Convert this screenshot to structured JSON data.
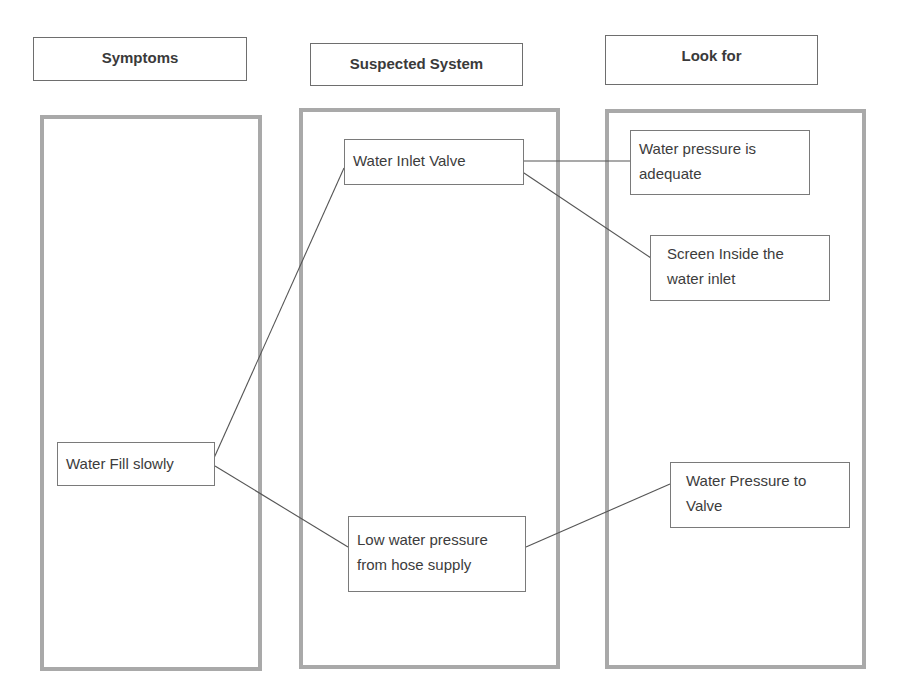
{
  "headers": {
    "symptoms": "Symptoms",
    "suspected_system": "Suspected System",
    "look_for": "Look for"
  },
  "nodes": {
    "symptom_water_fill": "Water Fill slowly",
    "system_inlet_valve": "Water Inlet Valve",
    "system_low_pressure": "Low water pressure from hose supply",
    "look_pressure_adequate": "Water pressure is adequate",
    "look_screen_inside": "Screen Inside the water inlet",
    "look_pressure_to_valve": "Water Pressure to Valve"
  },
  "connections": [
    {
      "from": "Water Fill slowly",
      "to": "Water Inlet Valve"
    },
    {
      "from": "Water Fill slowly",
      "to": "Low water pressure from hose supply"
    },
    {
      "from": "Water Inlet Valve",
      "to": "Water pressure is adequate"
    },
    {
      "from": "Water Inlet Valve",
      "to": "Screen Inside the water inlet"
    },
    {
      "from": "Low water pressure from hose supply",
      "to": "Water Pressure to Valve"
    }
  ],
  "colors": {
    "column_border": "#a9a9a9",
    "box_border": "#7a7a7a",
    "text": "#3a3a3a",
    "connector": "#555555"
  }
}
